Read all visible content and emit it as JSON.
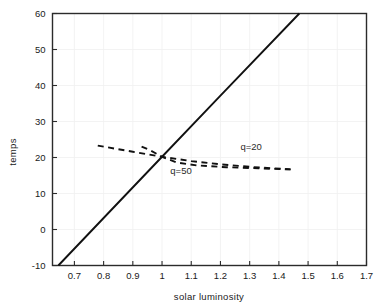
{
  "chart_data": {
    "type": "line",
    "title": "",
    "xlabel": "solar luminosity",
    "ylabel": "temps",
    "xlim": [
      0.625,
      1.7
    ],
    "ylim": [
      -10,
      60
    ],
    "grid": true,
    "legend_position": "inline-annotation",
    "xticks": [
      0.7,
      0.8,
      0.9,
      1,
      1.1,
      1.2,
      1.3,
      1.4,
      1.5,
      1.6,
      1.7
    ],
    "xticklabels": [
      "0.7",
      "0.8",
      "0.9",
      "1",
      "1.1",
      "1.2",
      "1.3",
      "1.4",
      "1.5",
      "1.6",
      "1.7"
    ],
    "yticks": [
      -10,
      0,
      10,
      20,
      30,
      40,
      50,
      60
    ],
    "yticklabels": [
      "-10",
      "0",
      "10",
      "20",
      "30",
      "40",
      "50",
      "60"
    ],
    "series": [
      {
        "name": "blackbody-equilibrium",
        "style": "solid",
        "color": "#111111",
        "x": [
          0.645,
          0.8,
          1.0,
          1.2,
          1.47
        ],
        "y": [
          -10,
          3.2,
          20.2,
          37.2,
          60
        ]
      },
      {
        "name": "q=20",
        "style": "dashed",
        "color": "#111111",
        "x": [
          0.78,
          0.9,
          1.0,
          1.1,
          1.2,
          1.3,
          1.44
        ],
        "y": [
          23.3,
          21.6,
          20.2,
          19.0,
          18.1,
          17.4,
          16.7
        ]
      },
      {
        "name": "q=50",
        "style": "dashed",
        "color": "#111111",
        "x": [
          0.93,
          0.96,
          1.0,
          1.05,
          1.12,
          1.22,
          1.33,
          1.44
        ],
        "y": [
          23.0,
          22.0,
          20.2,
          18.6,
          17.8,
          17.3,
          17.0,
          16.7
        ]
      }
    ],
    "annotations": [
      {
        "text": "q=20",
        "x": 1.305,
        "y": 22.0
      },
      {
        "text": "q=50",
        "x": 1.065,
        "y": 15.4
      }
    ]
  },
  "colors": {
    "line": "#111111",
    "frame": "#2b2b2b",
    "grid": "#f0f0f0",
    "text": "#1a1a1a",
    "background": "#ffffff"
  }
}
